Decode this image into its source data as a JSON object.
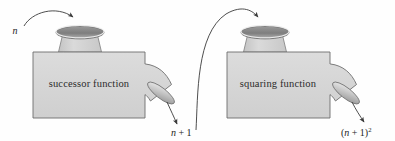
{
  "diagram": {
    "background_color": "#fefefe",
    "body_fill": "#d3d3d3",
    "body_stroke": "#6e6e6e",
    "funnel_fill": "#cfcfcf",
    "opening_dark": "#8a8a8a",
    "opening_rim": "#efefef",
    "arrow_color": "#3a3a3a",
    "text_color": "#2b2b2b",
    "input_label": "n",
    "machines": [
      {
        "id": "successor",
        "label": "successor function",
        "output_label_parts": {
          "variable": "n",
          "operator": "+",
          "constant": "1",
          "exponent": ""
        },
        "output_label_text": "n + 1"
      },
      {
        "id": "squaring",
        "label": "squaring function",
        "output_label_parts": {
          "open": "(",
          "variable": "n",
          "operator": "+",
          "constant": "1",
          "close": ")",
          "exponent": "2"
        },
        "output_label_text": "(n + 1)2"
      }
    ],
    "arrows": [
      {
        "id": "input-arrow",
        "from": "n",
        "to": "successor-hopper"
      },
      {
        "id": "successor-output-arrow",
        "from": "successor-spout",
        "to": "n + 1"
      },
      {
        "id": "transfer-arrow",
        "from": "n + 1",
        "to": "squaring-hopper"
      },
      {
        "id": "squaring-output-arrow",
        "from": "squaring-spout",
        "to": "(n + 1)2"
      }
    ]
  }
}
